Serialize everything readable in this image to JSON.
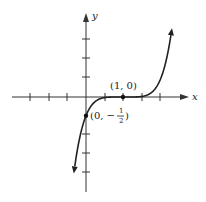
{
  "chart_data": {
    "type": "line",
    "title": "",
    "function": "y = 1/2 (x - 1)^5",
    "xlabel": "x",
    "ylabel": "y",
    "tick_step": 0.5,
    "x_ticks": [
      -1.5,
      -1,
      -0.5,
      0.5,
      1,
      1.5,
      2
    ],
    "y_ticks": [
      -1.5,
      -1,
      -0.5,
      0.5,
      1,
      1.5
    ],
    "xlim": [
      -2.3,
      2.7
    ],
    "ylim": [
      -2.5,
      2.3
    ],
    "grid": false,
    "series": [
      {
        "name": "curve",
        "x": [
          -0.37,
          0,
          0.5,
          1,
          1.5,
          2,
          2.33
        ],
        "y": [
          -2.41,
          -0.5,
          -0.016,
          0,
          0.016,
          0.5,
          2.06
        ]
      }
    ],
    "points": [
      {
        "x": 1,
        "y": 0,
        "label": "(1, 0)"
      },
      {
        "x": 0,
        "y": -0.5,
        "label": "(0, −½)"
      }
    ]
  },
  "labels": {
    "x_axis": "x",
    "y_axis": "y",
    "point_1": "(1, 0)",
    "point_2_prefix": "(0, −",
    "point_2_num": "1",
    "point_2_den": "2",
    "point_2_suffix": ")"
  }
}
